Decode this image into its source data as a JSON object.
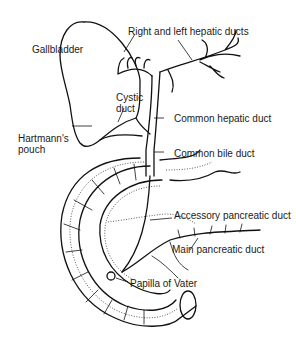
{
  "diagram": {
    "labels": {
      "gallbladder": "Gallbladder",
      "hepatic_ducts": "Right and left hepatic ducts",
      "cystic_duct_line1": "Cystic",
      "cystic_duct_line2": "duct",
      "common_hepatic_duct": "Common hepatic duct",
      "hartmann_line1": "Hartmann's",
      "hartmann_line2": "pouch",
      "common_bile_duct": "Common bile duct",
      "accessory_pancreatic_duct": "Accessory pancreatic duct",
      "main_pancreatic_duct": "Main pancreatic duct",
      "papilla_of_vater": "Papilla of Vater"
    },
    "colors": {
      "ink": "#111111",
      "background": "#ffffff"
    }
  }
}
